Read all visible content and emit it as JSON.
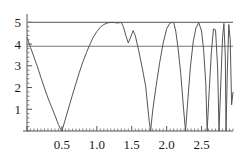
{
  "chart_data": {
    "type": "line",
    "title": "",
    "xlabel": "",
    "ylabel": "",
    "xlim": [
      0.0,
      2.95
    ],
    "ylim": [
      0.0,
      5.2
    ],
    "grid": false,
    "legend": false,
    "xticks": [
      0.5,
      1.0,
      1.5,
      2.0,
      2.5
    ],
    "xtick_labels": [
      "0.5",
      "1.0",
      "1.5",
      "2.0",
      "2.5"
    ],
    "yticks": [
      1,
      2,
      3,
      4,
      5
    ],
    "ytick_labels": [
      "1",
      "2",
      "3",
      "4",
      "5"
    ],
    "series": [
      {
        "name": "oscillating-absolute-value-curve",
        "color": "#555555",
        "x": [
          0.0,
          0.05,
          0.1,
          0.15,
          0.2,
          0.25,
          0.3,
          0.35,
          0.4,
          0.45,
          0.49,
          0.5,
          0.55,
          0.6,
          0.65,
          0.7,
          0.75,
          0.8,
          0.85,
          0.9,
          0.95,
          1.0,
          1.05,
          1.1,
          1.15,
          1.2,
          1.25,
          1.3,
          1.35,
          1.38,
          1.42,
          1.45,
          1.48,
          1.52,
          1.55,
          1.6,
          1.65,
          1.7,
          1.75,
          1.77,
          1.8,
          1.85,
          1.9,
          1.95,
          2.0,
          2.05,
          2.1,
          2.13,
          2.16,
          2.2,
          2.24,
          2.27,
          2.3,
          2.34,
          2.38,
          2.42,
          2.46,
          2.5,
          2.53,
          2.56,
          2.58,
          2.61,
          2.64,
          2.67,
          2.7,
          2.73,
          2.75,
          2.78,
          2.8,
          2.82,
          2.84,
          2.85,
          2.87,
          2.89,
          2.91,
          2.93,
          2.95
        ],
        "y": [
          4.3,
          3.85,
          3.4,
          2.95,
          2.45,
          1.98,
          1.52,
          1.12,
          0.72,
          0.3,
          0.02,
          0.0,
          0.55,
          1.1,
          1.65,
          2.18,
          2.7,
          3.18,
          3.6,
          3.98,
          4.32,
          4.58,
          4.78,
          4.9,
          4.97,
          5.0,
          4.99,
          4.97,
          5.0,
          4.8,
          4.35,
          4.05,
          4.28,
          4.62,
          4.4,
          3.7,
          2.9,
          2.05,
          0.45,
          0.0,
          0.95,
          2.1,
          3.15,
          4.05,
          4.7,
          4.98,
          5.0,
          4.6,
          3.9,
          2.7,
          1.1,
          0.0,
          1.3,
          2.95,
          4.1,
          4.75,
          4.98,
          4.6,
          3.7,
          2.2,
          0.0,
          1.9,
          3.6,
          4.7,
          4.65,
          2.9,
          0.0,
          2.6,
          4.3,
          4.95,
          3.4,
          0.0,
          2.9,
          4.9,
          4.2,
          1.2,
          1.8
        ]
      }
    ],
    "reference_lines": [
      {
        "name": "upper-bound-line",
        "y": 5.0,
        "color": "#777777"
      },
      {
        "name": "lower-bound-line",
        "y": 3.9,
        "color": "#777777"
      }
    ],
    "axis_color": "#555555"
  }
}
